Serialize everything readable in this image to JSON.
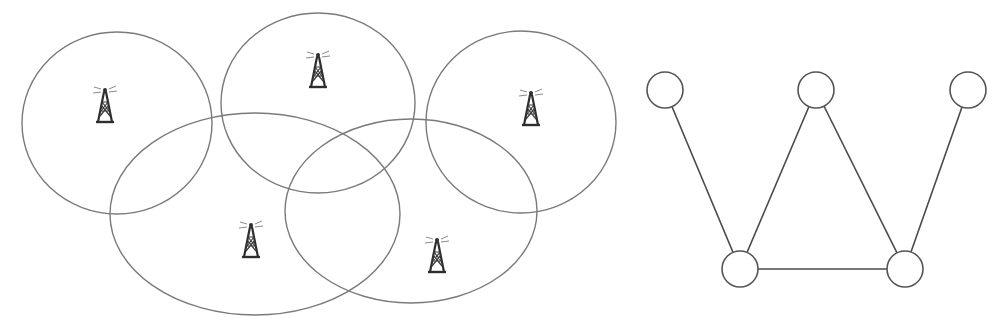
{
  "diagram": {
    "colors": {
      "background": "#ffffff",
      "coverage_stroke": "#7a7a7a",
      "edge_stroke": "#4a4a4a",
      "node_stroke": "#555555",
      "tower": "#2e2e2e"
    },
    "coverage_areas": [
      {
        "id": "area-1",
        "cx": 117,
        "cy": 123,
        "rx": 95,
        "ry": 91,
        "tower": {
          "x": 105,
          "y": 105,
          "icon": "radio-tower-icon"
        }
      },
      {
        "id": "area-2",
        "cx": 318,
        "cy": 103,
        "rx": 97,
        "ry": 90,
        "tower": {
          "x": 318,
          "y": 70,
          "icon": "radio-tower-icon"
        }
      },
      {
        "id": "area-3",
        "cx": 521,
        "cy": 122,
        "rx": 95,
        "ry": 91,
        "tower": {
          "x": 531,
          "y": 108,
          "icon": "radio-tower-icon"
        }
      },
      {
        "id": "area-4",
        "cx": 255,
        "cy": 214,
        "rx": 145,
        "ry": 101,
        "tower": {
          "x": 251,
          "y": 240,
          "icon": "radio-tower-icon"
        }
      },
      {
        "id": "area-5",
        "cx": 411,
        "cy": 211,
        "rx": 126,
        "ry": 92,
        "tower": {
          "x": 437,
          "y": 255,
          "icon": "radio-tower-icon"
        }
      }
    ],
    "graph": {
      "node_radius": 18,
      "nodes": [
        {
          "id": "n1",
          "x": 665,
          "y": 90
        },
        {
          "id": "n2",
          "x": 816,
          "y": 90
        },
        {
          "id": "n3",
          "x": 968,
          "y": 90
        },
        {
          "id": "n4",
          "x": 740,
          "y": 269
        },
        {
          "id": "n5",
          "x": 905,
          "y": 269
        }
      ],
      "edges": [
        {
          "from": "n1",
          "to": "n4"
        },
        {
          "from": "n2",
          "to": "n4"
        },
        {
          "from": "n2",
          "to": "n5"
        },
        {
          "from": "n3",
          "to": "n5"
        },
        {
          "from": "n4",
          "to": "n5"
        }
      ]
    }
  }
}
